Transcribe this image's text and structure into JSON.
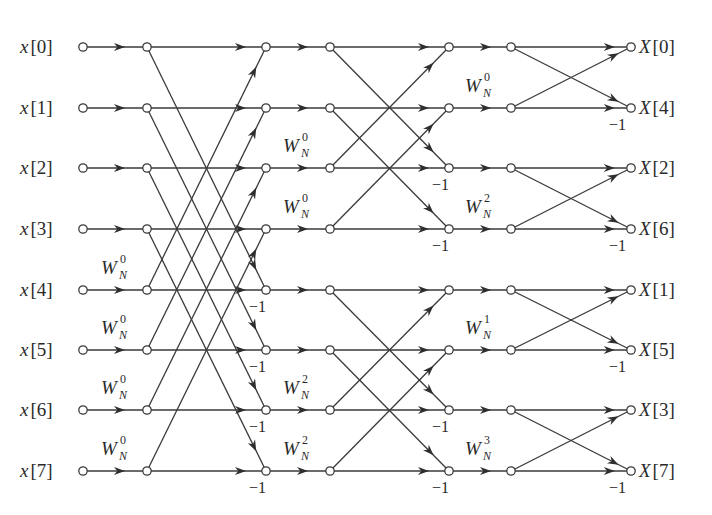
{
  "diagram": {
    "type": "8-point decimation-in-frequency FFT flow graph",
    "colors": {
      "line": "#3a3a3a",
      "node_fill": "#ffffff",
      "text": "#2a2a2a",
      "background": "#ffffff"
    },
    "layout": {
      "row_y": [
        47,
        108,
        168,
        229,
        290,
        350,
        410,
        471
      ],
      "columns": {
        "input": 83,
        "s1_in": 147,
        "s1_out": 266,
        "s2_in": 330,
        "s2_out": 449,
        "s3_in": 511,
        "output": 631
      }
    },
    "inputs": [
      {
        "name": "x",
        "index": "0"
      },
      {
        "name": "x",
        "index": "1"
      },
      {
        "name": "x",
        "index": "2"
      },
      {
        "name": "x",
        "index": "3"
      },
      {
        "name": "x",
        "index": "4"
      },
      {
        "name": "x",
        "index": "5"
      },
      {
        "name": "x",
        "index": "6"
      },
      {
        "name": "x",
        "index": "7"
      }
    ],
    "outputs": [
      {
        "name": "X",
        "index": "0"
      },
      {
        "name": "X",
        "index": "4"
      },
      {
        "name": "X",
        "index": "2"
      },
      {
        "name": "X",
        "index": "6"
      },
      {
        "name": "X",
        "index": "1"
      },
      {
        "name": "X",
        "index": "5"
      },
      {
        "name": "X",
        "index": "3"
      },
      {
        "name": "X",
        "index": "7"
      }
    ],
    "stages": [
      {
        "name": "stage-1",
        "span": 4,
        "twiddles": [
          {
            "row": 4,
            "base": "W",
            "sub": "N",
            "exp": "0"
          },
          {
            "row": 5,
            "base": "W",
            "sub": "N",
            "exp": "0"
          },
          {
            "row": 6,
            "base": "W",
            "sub": "N",
            "exp": "0"
          },
          {
            "row": 7,
            "base": "W",
            "sub": "N",
            "exp": "0"
          }
        ],
        "negations": [
          {
            "row": 4,
            "text": "−1"
          },
          {
            "row": 5,
            "text": "−1"
          },
          {
            "row": 6,
            "text": "−1"
          },
          {
            "row": 7,
            "text": "−1"
          }
        ]
      },
      {
        "name": "stage-2",
        "span": 2,
        "twiddles": [
          {
            "row": 2,
            "base": "W",
            "sub": "N",
            "exp": "0"
          },
          {
            "row": 3,
            "base": "W",
            "sub": "N",
            "exp": "0"
          },
          {
            "row": 6,
            "base": "W",
            "sub": "N",
            "exp": "2"
          },
          {
            "row": 7,
            "base": "W",
            "sub": "N",
            "exp": "2"
          }
        ],
        "negations": [
          {
            "row": 2,
            "text": "−1"
          },
          {
            "row": 3,
            "text": "−1"
          },
          {
            "row": 6,
            "text": "−1"
          },
          {
            "row": 7,
            "text": "−1"
          }
        ]
      },
      {
        "name": "stage-3",
        "span": 1,
        "twiddles": [
          {
            "row": 1,
            "base": "W",
            "sub": "N",
            "exp": "0"
          },
          {
            "row": 3,
            "base": "W",
            "sub": "N",
            "exp": "2"
          },
          {
            "row": 5,
            "base": "W",
            "sub": "N",
            "exp": "1"
          },
          {
            "row": 7,
            "base": "W",
            "sub": "N",
            "exp": "3"
          }
        ],
        "negations": [
          {
            "row": 1,
            "text": "−1"
          },
          {
            "row": 3,
            "text": "−1"
          },
          {
            "row": 5,
            "text": "−1"
          },
          {
            "row": 7,
            "text": "−1"
          }
        ]
      }
    ]
  }
}
